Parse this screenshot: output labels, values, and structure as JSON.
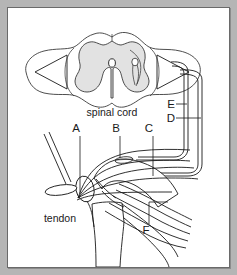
{
  "figure": {
    "background_color": "#b5b5b5",
    "panel_color": "#ffffff",
    "border_color": "#6a6a6a",
    "ink_color": "#1a1a1a",
    "gray_matter_color": "#e2e2e2"
  },
  "labels": {
    "spinal_cord": "spinal cord",
    "tendon": "tendon",
    "central_canal": "O",
    "letters": [
      {
        "id": "A",
        "text": "A"
      },
      {
        "id": "B",
        "text": "B"
      },
      {
        "id": "C",
        "text": "C"
      },
      {
        "id": "D",
        "text": "D"
      },
      {
        "id": "E",
        "text": "E"
      },
      {
        "id": "F",
        "text": "F"
      }
    ]
  },
  "parts": {
    "spinal_cord_section": "spinal-cord-cross-section",
    "gray_matter": "gray-matter-butterfly",
    "white_matter": "white-matter-outline",
    "cell_body": "motor-neuron-cell-body",
    "dorsal_root": "dorsal-root-nerve",
    "ventral_root": "ventral-root-nerve",
    "reflex_hammer": "reflex-hammer",
    "patella": "patella-kneecap",
    "femur": "femur-bone",
    "tibia": "tibia-bone",
    "muscle_fibers": "muscle-fibres",
    "nerve_fibers": "nerve-fibres"
  }
}
